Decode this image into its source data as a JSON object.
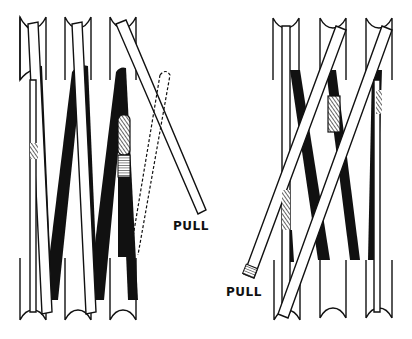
{
  "figure": {
    "left_panel": {
      "description": "Three grooved pulleys with crossed rods; one rod pulled out to the right, dashed outline showing former position",
      "pull_label": "PULL"
    },
    "right_panel": {
      "description": "Three grooved pulleys with crossed rods; rod pulled out to the lower left",
      "pull_label": "PULL"
    },
    "colors": {
      "ink": "#111111",
      "paper": "#ffffff"
    }
  }
}
